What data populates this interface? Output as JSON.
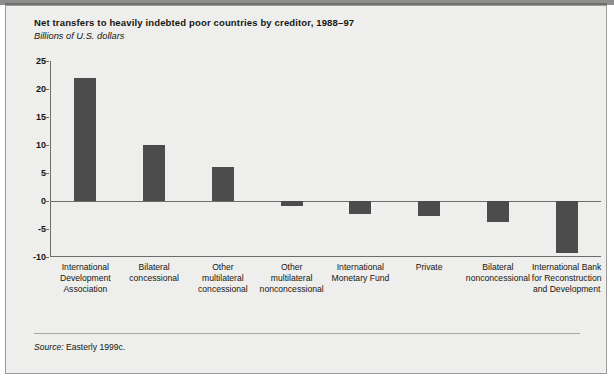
{
  "figure": {
    "title": "Net transfers to heavily indebted poor countries by creditor, 1988–97",
    "subtitle": "Billions of U.S. dollars",
    "source_label": "Source:",
    "source_text": " Easterly 1999c.",
    "bar_color": "#4c4c4c",
    "background_color": "#eeeeec",
    "axis_color": "#6d6d6b"
  },
  "chart_data": {
    "type": "bar",
    "title": "Net transfers to heavily indebted poor countries by creditor, 1988–97",
    "subtitle": "Billions of U.S. dollars",
    "xlabel": "",
    "ylabel": "Billions of U.S. dollars",
    "ylim": [
      -10,
      25
    ],
    "yticks": [
      25,
      20,
      15,
      10,
      5,
      0,
      -5,
      -10
    ],
    "ytick_labels": [
      "25",
      "20",
      "15",
      "10",
      "5",
      "0",
      "-5",
      "-10"
    ],
    "grid": false,
    "legend": false,
    "zero_line": true,
    "categories": [
      "International Development Association",
      "Bilateral concessional",
      "Other multilateral concessional",
      "Other multilateral nonconcessional",
      "International Monetary Fund",
      "Private",
      "Bilateral nonconcessional",
      "International Bank for Reconstruction and Development"
    ],
    "category_lines": [
      [
        "International",
        "Development",
        "Association"
      ],
      [
        "Bilateral",
        "concessional"
      ],
      [
        "Other",
        "multilateral",
        "concessional"
      ],
      [
        "Other",
        "multilateral",
        "nonconcessional"
      ],
      [
        "International",
        "Monetary Fund"
      ],
      [
        "Private"
      ],
      [
        "Bilateral",
        "nonconcessional"
      ],
      [
        "International Bank",
        "for Reconstruction",
        "and Development"
      ]
    ],
    "values": [
      22,
      10,
      6,
      -0.9,
      -2.3,
      -2.7,
      -3.7,
      -9.3
    ],
    "source": "Source: Easterly 1999c."
  }
}
